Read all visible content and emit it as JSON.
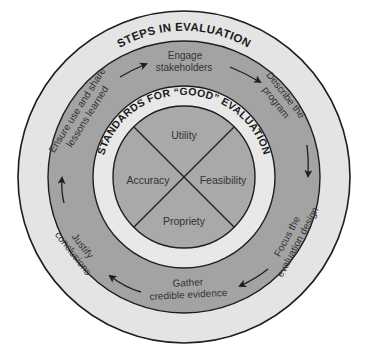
{
  "diagram": {
    "outer_title": "STEPS IN EVALUATION",
    "inner_title": "STANDARDS FOR “GOOD” EVALUATION",
    "steps": [
      {
        "id": "engage",
        "lines": [
          "Engage",
          "stakeholders"
        ]
      },
      {
        "id": "describe",
        "lines": [
          "Describe the",
          "program"
        ]
      },
      {
        "id": "focus",
        "lines": [
          "Focus the",
          "evaluation design"
        ]
      },
      {
        "id": "gather",
        "lines": [
          "Gather",
          "credible evidence"
        ]
      },
      {
        "id": "justify",
        "lines": [
          "Justify",
          "conclusions"
        ]
      },
      {
        "id": "ensure",
        "lines": [
          "Ensure use and share",
          "lessons learned"
        ]
      }
    ],
    "standards": {
      "top": "Utility",
      "right": "Feasibility",
      "bottom": "Propriety",
      "left": "Accuracy"
    },
    "colors": {
      "outer_ring": "#e4e4e4",
      "steps_ring": "#a3a3a3",
      "standards_ring": "#e8e8e8",
      "core": "#a9a9a9",
      "stroke": "#1e1e1e"
    }
  }
}
